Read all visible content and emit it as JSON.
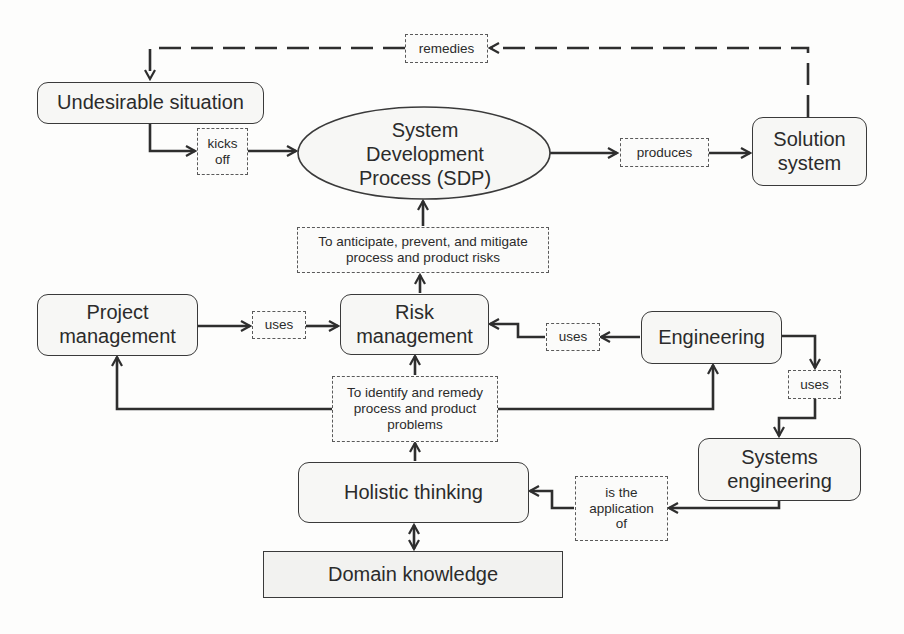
{
  "diagram": {
    "nodes": {
      "undesirable_situation": "Undesirable situation",
      "sdp": [
        "System",
        "Development",
        "Process (SDP)"
      ],
      "solution_system": [
        "Solution",
        "system"
      ],
      "project_management": [
        "Project",
        "management"
      ],
      "risk_management": [
        "Risk",
        "management"
      ],
      "engineering": "Engineering",
      "systems_engineering": [
        "Systems",
        "engineering"
      ],
      "holistic_thinking": "Holistic thinking",
      "domain_knowledge": "Domain knowledge"
    },
    "edge_labels": {
      "remedies": "remedies",
      "kicks_off": [
        "kicks",
        "off"
      ],
      "produces": "produces",
      "anticipate": [
        "To anticipate, prevent, and mitigate",
        "process and product risks"
      ],
      "uses_pm": "uses",
      "uses_eng": "uses",
      "uses_se": "uses",
      "identify": [
        "To identify and remedy",
        "process and product",
        "problems"
      ],
      "application": [
        "is the",
        "application",
        "of"
      ]
    },
    "edges": [
      {
        "from": "solution_system",
        "to": "undesirable_situation",
        "label": "remedies",
        "style": "dashed"
      },
      {
        "from": "undesirable_situation",
        "to": "sdp",
        "label": "kicks off"
      },
      {
        "from": "sdp",
        "to": "solution_system",
        "label": "produces"
      },
      {
        "from": "risk_management",
        "to": "sdp",
        "label": "To anticipate, prevent, and mitigate process and product risks"
      },
      {
        "from": "project_management",
        "to": "risk_management",
        "label": "uses"
      },
      {
        "from": "engineering",
        "to": "risk_management",
        "label": "uses"
      },
      {
        "from": "engineering",
        "to": "systems_engineering",
        "label": "uses"
      },
      {
        "from": "holistic_thinking",
        "to": "risk_management",
        "label": "To identify and remedy process and product problems"
      },
      {
        "from": "holistic_thinking",
        "to": "project_management",
        "label": "To identify and remedy process and product problems"
      },
      {
        "from": "holistic_thinking",
        "to": "engineering",
        "label": "To identify and remedy process and product problems"
      },
      {
        "from": "systems_engineering",
        "to": "holistic_thinking",
        "label": "is the application of"
      },
      {
        "from": "holistic_thinking",
        "to": "domain_knowledge",
        "label": "",
        "style": "bidirectional"
      }
    ]
  },
  "colors": {
    "stroke": "#2e2e2e",
    "node_fill": "#f7f7f5",
    "background": "#fdfdfc"
  }
}
